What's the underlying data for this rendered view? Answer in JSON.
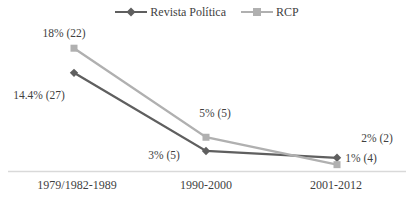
{
  "chart_data": {
    "type": "line",
    "title": "",
    "xlabel": "",
    "ylabel": "",
    "grid": false,
    "legend_position": "top-center",
    "ylim": [
      0,
      20
    ],
    "categories": [
      "1979/1982-1989",
      "1990-2000",
      "2001-2012"
    ],
    "series": [
      {
        "name": "Revista Política",
        "marker": "diamond",
        "color": "#5f5f5f",
        "values": [
          14.4,
          3,
          2
        ],
        "data_labels": [
          "14.4% (27)",
          "3% (5)",
          "2% (2)"
        ]
      },
      {
        "name": "RCP",
        "marker": "square",
        "color": "#b0b0b0",
        "values": [
          18,
          5,
          1
        ],
        "data_labels": [
          "18% (22)",
          "5% (5)",
          "1% (4)"
        ]
      }
    ],
    "colors": {
      "label_text": "#3f3f3f",
      "axis_line": "#d9d9d9"
    },
    "layout": {
      "x_px": [
        74,
        206,
        337
      ],
      "baseline_y_px": 171.5,
      "px_per_unit": 6.85,
      "axis_x1_px": 8,
      "axis_x2_px": 406,
      "label_anchor_px": [
        [
          {
            "x": 39,
            "y": 96
          },
          {
            "x": 164,
            "y": 156
          },
          {
            "x": 377,
            "y": 139
          }
        ],
        [
          {
            "x": 64,
            "y": 34
          },
          {
            "x": 215,
            "y": 114
          },
          {
            "x": 361,
            "y": 159
          }
        ]
      ]
    }
  }
}
